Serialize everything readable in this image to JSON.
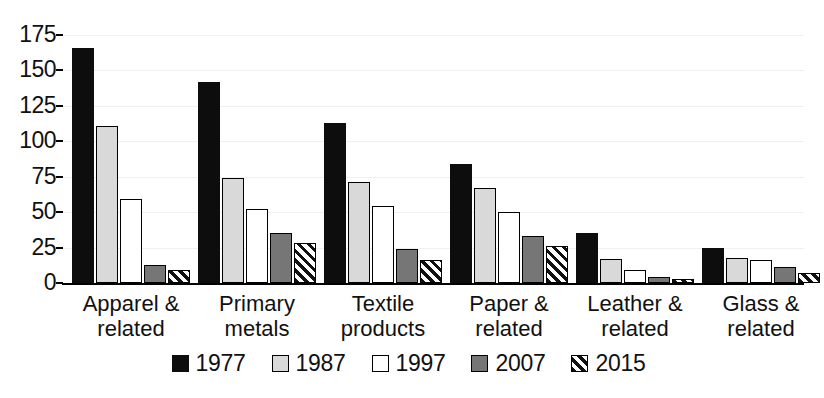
{
  "chart_data": {
    "type": "bar",
    "title": "",
    "subtitle": "",
    "xlabel": "",
    "ylabel": "",
    "ylim": [
      0,
      175
    ],
    "yticks": [
      0,
      25,
      50,
      75,
      100,
      125,
      150,
      175
    ],
    "grid": true,
    "legend_position": "bottom",
    "categories": [
      "Apparel &\nrelated",
      "Primary\nmetals",
      "Textile\nproducts",
      "Paper &\nrelated",
      "Leather &\nrelated",
      "Glass &\nrelated"
    ],
    "series": [
      {
        "name": "1977",
        "color": "#0d0d0d",
        "pattern": "solid-black",
        "values": [
          166,
          142,
          113,
          84,
          35,
          25
        ]
      },
      {
        "name": "1987",
        "color": "#d9d9d9",
        "pattern": "light-gray",
        "values": [
          111,
          74,
          71,
          67,
          17,
          18
        ]
      },
      {
        "name": "1997",
        "color": "#ffffff",
        "pattern": "white",
        "values": [
          59,
          52,
          54,
          50,
          9,
          16
        ]
      },
      {
        "name": "2007",
        "color": "#767676",
        "pattern": "dark-gray",
        "values": [
          13,
          35,
          24,
          33,
          4,
          11
        ]
      },
      {
        "name": "2015",
        "color": "#ffffff",
        "pattern": "diagonal-hatch",
        "values": [
          9,
          28,
          16,
          26,
          3,
          7
        ]
      }
    ]
  },
  "axis": {
    "y_tick_labels": [
      "175",
      "150",
      "125",
      "100",
      "75",
      "50",
      "25",
      "0"
    ]
  },
  "legend": {
    "items": [
      {
        "label": "1977"
      },
      {
        "label": "1987"
      },
      {
        "label": "1997"
      },
      {
        "label": "2007"
      },
      {
        "label": "2015"
      }
    ]
  }
}
